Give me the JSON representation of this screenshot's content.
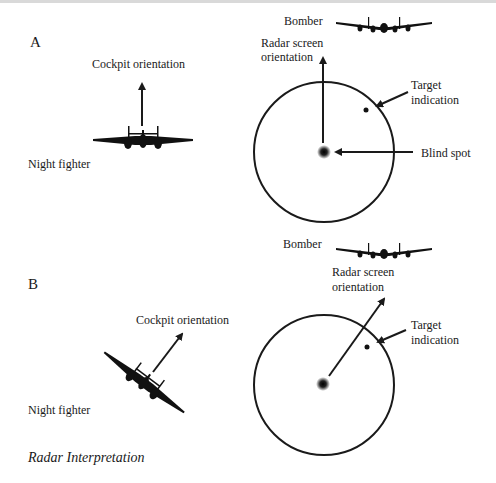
{
  "panels": [
    {
      "letter": "A",
      "cockpit_label": "Cockpit orientation",
      "fighter_label": "Night fighter",
      "bomber_label": "Bomber",
      "radar_label_line1": "Radar screen",
      "radar_label_line2": "orientation",
      "target_label_line1": "Target",
      "target_label_line2": "indication",
      "blind_spot_label": "Blind spot"
    },
    {
      "letter": "B",
      "cockpit_label": "Cockpit orientation",
      "fighter_label": "Night fighter",
      "bomber_label": "Bomber",
      "radar_label_line1": "Radar screen",
      "radar_label_line2": "orientation",
      "target_label_line1": "Target",
      "target_label_line2": "indication"
    }
  ],
  "caption": "Radar Interpretation",
  "colors": {
    "ink": "#1a1a1a",
    "background": "#ffffff"
  }
}
